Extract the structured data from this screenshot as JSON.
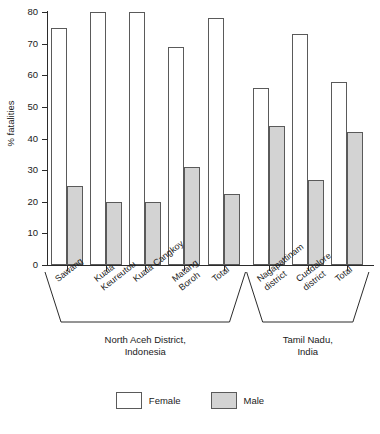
{
  "chart_data": {
    "type": "bar",
    "title": "",
    "xlabel": "",
    "ylabel": "% fatalities",
    "ylim": [
      0,
      80
    ],
    "yticks": [
      0,
      10,
      20,
      30,
      40,
      50,
      60,
      70,
      80
    ],
    "grid": false,
    "legend_position": "bottom-center",
    "categories": [
      "Sawang",
      "Kuala Keureutou",
      "Kuala Cangkoy",
      "Matang Boroh",
      "Total",
      "Nagapattinam district",
      "Cuddalore district",
      "Total"
    ],
    "category_lines": [
      [
        "Sawang"
      ],
      [
        "Kuala",
        "Keureutou"
      ],
      [
        "Kuala Cangkoy"
      ],
      [
        "Matang",
        "Boroh"
      ],
      [
        "Total"
      ],
      [
        "Nagapattinam",
        "district"
      ],
      [
        "Cuddalore",
        "district"
      ],
      [
        "Total"
      ]
    ],
    "series": [
      {
        "name": "Female",
        "color": "#ffffff",
        "values": [
          75,
          80,
          80,
          69,
          78,
          56,
          73,
          58
        ]
      },
      {
        "name": "Male",
        "color": "#d3d3d3",
        "values": [
          25,
          20,
          20,
          31,
          22.5,
          44,
          27,
          42
        ]
      }
    ],
    "groups": [
      {
        "label": "North Aceh District,\nIndonesia",
        "categories": [
          "Sawang",
          "Kuala Keureutou",
          "Kuala Cangkoy",
          "Matang Boroh",
          "Total"
        ]
      },
      {
        "label": "Tamil Nadu,\nIndia",
        "categories": [
          "Nagapattinam district",
          "Cuddalore district",
          "Total"
        ]
      }
    ]
  },
  "legend": {
    "items": [
      {
        "label": "Female",
        "swatch": "female"
      },
      {
        "label": "Male",
        "swatch": "male"
      }
    ]
  }
}
